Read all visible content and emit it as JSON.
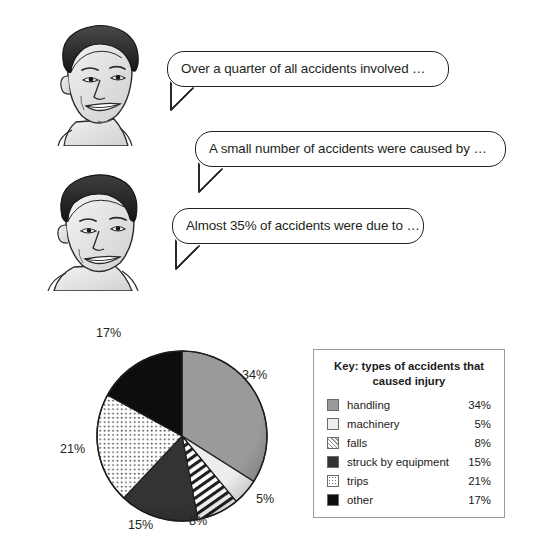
{
  "speech_bubbles": [
    {
      "id": "bubble-1",
      "text": "Over a quarter of all accidents involved …"
    },
    {
      "id": "bubble-2",
      "text": "A small number of accidents were caused by …"
    },
    {
      "id": "bubble-3",
      "text": "Almost 35% of accidents were due to …"
    }
  ],
  "legend": {
    "title": "Key: types of accidents that caused injury",
    "rows": [
      {
        "label": "handling",
        "value": "34%",
        "swatch": "handling-swatch",
        "color": "#9a9a9a"
      },
      {
        "label": "machinery",
        "value": "5%",
        "swatch": "machinery-swatch",
        "color": "#ededed"
      },
      {
        "label": "falls",
        "value": "8%",
        "swatch": "falls-swatch",
        "color": "#ffffff"
      },
      {
        "label": "struck by equipment",
        "value": "15%",
        "swatch": "struck-swatch",
        "color": "#333333"
      },
      {
        "label": "trips",
        "value": "21%",
        "swatch": "trips-swatch",
        "color": "#ffffff"
      },
      {
        "label": "other",
        "value": "17%",
        "swatch": "other-swatch",
        "color": "#0d0d0d"
      }
    ]
  },
  "pie_labels": [
    {
      "text": "34%",
      "x": 182,
      "y": 42
    },
    {
      "text": "5%",
      "x": 196,
      "y": 166
    },
    {
      "text": "8%",
      "x": 129,
      "y": 188
    },
    {
      "text": "15%",
      "x": 68,
      "y": 192
    },
    {
      "text": "21%",
      "x": 0,
      "y": 116
    },
    {
      "text": "17%",
      "x": 36,
      "y": 0
    }
  ],
  "chart_data": {
    "type": "pie",
    "title": "Key: types of accidents that caused injury",
    "categories": [
      "handling",
      "machinery",
      "falls",
      "struck by equipment",
      "trips",
      "other"
    ],
    "values": [
      34,
      5,
      8,
      15,
      21,
      17
    ],
    "unit": "%",
    "data_labels": [
      "34%",
      "5%",
      "8%",
      "15%",
      "21%",
      "17%"
    ],
    "start_angle_deg": 0,
    "direction": "clockwise",
    "legend_position": "right",
    "grid": false,
    "slice_styles": [
      {
        "name": "handling",
        "fill": "#9a9a9a",
        "pattern": "solid"
      },
      {
        "name": "machinery",
        "fill": "#ededed",
        "pattern": "solid"
      },
      {
        "name": "falls",
        "fill": "#ffffff",
        "pattern": "diagonal-stripes"
      },
      {
        "name": "struck by equipment",
        "fill": "#333333",
        "pattern": "solid"
      },
      {
        "name": "trips",
        "fill": "#ffffff",
        "pattern": "dots"
      },
      {
        "name": "other",
        "fill": "#0d0d0d",
        "pattern": "solid"
      }
    ]
  }
}
